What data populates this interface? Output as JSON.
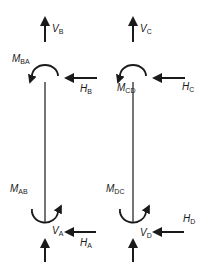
{
  "diagram": {
    "type": "free-body diagram of two columns",
    "columns": [
      {
        "id": "AB",
        "top_node": "B",
        "bottom_node": "A",
        "labels": {
          "top_vertical": {
            "main": "V",
            "sub": "B"
          },
          "top_moment": {
            "main": "M",
            "sub": "BA"
          },
          "top_horizontal": {
            "main": "H",
            "sub": "B"
          },
          "bottom_moment": {
            "main": "M",
            "sub": "AB"
          },
          "bottom_horizontal": {
            "main": "H",
            "sub": "A"
          },
          "bottom_vertical": {
            "main": "V",
            "sub": "A"
          }
        }
      },
      {
        "id": "CD",
        "top_node": "C",
        "bottom_node": "D",
        "labels": {
          "top_vertical": {
            "main": "V",
            "sub": "C"
          },
          "top_moment": {
            "main": "M",
            "sub": "CD"
          },
          "top_horizontal": {
            "main": "H",
            "sub": "C"
          },
          "bottom_moment": {
            "main": "M",
            "sub": "DC"
          },
          "bottom_horizontal": {
            "main": "H",
            "sub": "D"
          },
          "bottom_vertical": {
            "main": "V",
            "sub": "D"
          }
        }
      }
    ],
    "stroke_color": "#1a1a1a"
  }
}
